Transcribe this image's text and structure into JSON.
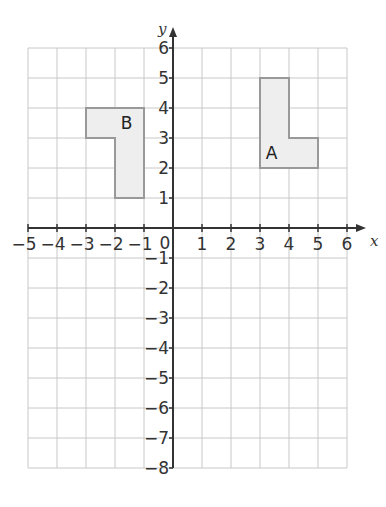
{
  "diagram": {
    "type": "coordinate-grid",
    "axes": {
      "x_label": "x",
      "y_label": "y",
      "x_range": [
        -5,
        6
      ],
      "y_range": [
        -8,
        6
      ],
      "origin_label": "0",
      "x_ticks": [
        "-5",
        "-4",
        "-3",
        "-2",
        "-1",
        "1",
        "2",
        "3",
        "4",
        "5",
        "6"
      ],
      "y_ticks": [
        "6",
        "5",
        "4",
        "3",
        "2",
        "1",
        "-1",
        "-2",
        "-3",
        "-4",
        "-5",
        "-6",
        "-7",
        "-8"
      ]
    },
    "shapes": [
      {
        "label": "A",
        "points": [
          [
            3,
            2
          ],
          [
            3,
            5
          ],
          [
            4,
            5
          ],
          [
            4,
            3
          ],
          [
            5,
            3
          ],
          [
            5,
            2
          ]
        ],
        "fill": "#eeeeee",
        "stroke": "#999999"
      },
      {
        "label": "B",
        "points": [
          [
            -3,
            4
          ],
          [
            -1,
            4
          ],
          [
            -1,
            1
          ],
          [
            -2,
            1
          ],
          [
            -2,
            3
          ],
          [
            -3,
            3
          ]
        ],
        "fill": "#eeeeee",
        "stroke": "#999999"
      }
    ],
    "colors": {
      "grid": "#c8c8c8",
      "axis": "#333333"
    }
  }
}
